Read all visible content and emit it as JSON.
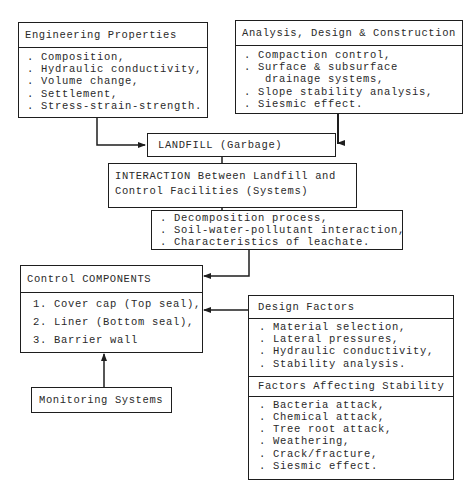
{
  "engineering_properties": {
    "title": "Engineering Properties",
    "items": [
      ". Composition,",
      ". Hydraulic conductivity,",
      ". Volume change,",
      ". Settlement,",
      ". Stress-strain-strength."
    ]
  },
  "analysis_design": {
    "title": "Analysis, Design & Construction",
    "items": [
      ". Compaction control,",
      ". Surface & subsurface",
      "   drainage systems,",
      ". Slope stability analysis,",
      ". Siesmic effect."
    ]
  },
  "landfill": {
    "title": "LANDFILL (Garbage)"
  },
  "interaction": {
    "line1": "INTERACTION Between Landfill and",
    "line2": "Control Facilities (Systems)"
  },
  "processes": {
    "items": [
      ". Decomposition process,",
      ". Soil-water-pollutant interaction,",
      ". Characteristics of leachate."
    ]
  },
  "control_components": {
    "title": "Control COMPONENTS",
    "items": [
      "1. Cover cap (Top seal),",
      "2. Liner (Bottom seal),",
      "3. Barrier wall"
    ]
  },
  "design_factors": {
    "title": "Design Factors",
    "items": [
      ". Material selection,",
      ". Lateral pressures,",
      ". Hydraulic conductivity,",
      ". Stability analysis."
    ]
  },
  "stability_factors": {
    "title": "Factors Affecting Stability",
    "items": [
      ". Bacteria attack,",
      ". Chemical attack,",
      ". Tree root attack,",
      ". Weathering,",
      ". Crack/fracture,",
      ". Siesmic effect."
    ]
  },
  "monitoring": {
    "title": "Monitoring Systems"
  }
}
